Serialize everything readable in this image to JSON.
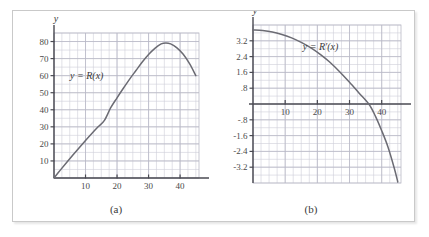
{
  "figure": {
    "panels": [
      {
        "caption": "(a)",
        "x_axis_label": "x",
        "y_axis_label": "y",
        "curve_label": "y = R(x)"
      },
      {
        "caption": "(b)",
        "x_axis_label": "x",
        "y_axis_label": "y",
        "curve_label": "y = R′(x)"
      }
    ]
  },
  "colors": {
    "curve": "#6b6b73",
    "grid_minor": "#cfcfd8",
    "grid_major": "#b9b9c6",
    "axis": "#4a4a52",
    "frame": "#c9c9c9",
    "background": "#ffffff",
    "text": "#4a4a4a"
  },
  "chart_data": [
    {
      "type": "line",
      "title": "",
      "subtitle": "",
      "caption": "(a)",
      "xlabel": "x",
      "ylabel": "y",
      "legend_position": "inside-left",
      "annotations": [
        "y = R(x)"
      ],
      "grid": true,
      "xlim": [
        0,
        46
      ],
      "ylim": [
        0,
        85
      ],
      "xticks": [
        10,
        20,
        30,
        40
      ],
      "xticklabels": [
        "10",
        "20",
        "30",
        "40"
      ],
      "yticks": [
        10,
        20,
        30,
        40,
        50,
        60,
        70,
        80
      ],
      "yticklabels": [
        "10",
        "20",
        "30",
        "40",
        "50",
        "60",
        "70",
        "80"
      ],
      "series": [
        {
          "name": "R(x)",
          "x": [
            0,
            2,
            4,
            6,
            8,
            10,
            12,
            14,
            16,
            18,
            20,
            22,
            24,
            26,
            28,
            30,
            32,
            34,
            35.5,
            37,
            39,
            41,
            43,
            45
          ],
          "y": [
            0,
            4.6,
            9.1,
            13.5,
            17.8,
            22.0,
            26.1,
            30.0,
            33.8,
            41.2,
            47.0,
            52.6,
            58.0,
            63.0,
            68.0,
            72.4,
            76.0,
            78.6,
            79.2,
            78.6,
            76.3,
            72.5,
            67.0,
            60.0
          ]
        }
      ]
    },
    {
      "type": "line",
      "title": "",
      "subtitle": "",
      "caption": "(b)",
      "xlabel": "x",
      "ylabel": "y",
      "legend_position": "inside-center",
      "annotations": [
        "y = R′(x)"
      ],
      "grid": true,
      "xlim": [
        0,
        46
      ],
      "ylim": [
        -4.0,
        4.0
      ],
      "xticks": [
        10,
        20,
        30,
        40
      ],
      "xticklabels": [
        "10",
        "20",
        "30",
        "40"
      ],
      "yticks": [
        3.2,
        2.4,
        1.6,
        0.8,
        -0.8,
        -1.6,
        -2.4,
        -3.2
      ],
      "yticklabels": [
        "3.2",
        "2.4",
        "1.6",
        ".8",
        "-.8",
        "-1.6",
        "-2.4",
        "-3.2"
      ],
      "zero_crossing": 36,
      "series": [
        {
          "name": "R'(x)",
          "x": [
            0,
            3,
            6,
            9,
            12,
            15,
            18,
            21,
            24,
            27,
            30,
            33,
            36,
            38,
            40,
            42,
            44,
            45
          ],
          "y": [
            3.75,
            3.72,
            3.65,
            3.52,
            3.35,
            3.12,
            2.84,
            2.5,
            2.1,
            1.62,
            1.1,
            0.55,
            0.0,
            -0.6,
            -1.35,
            -2.2,
            -3.3,
            -3.95
          ]
        }
      ]
    }
  ]
}
